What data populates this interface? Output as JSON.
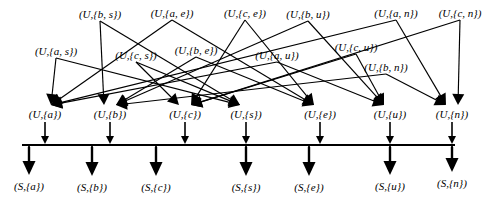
{
  "diagram": {
    "type": "directed-graph",
    "stroke_color": "#000000",
    "background_color": "#ffffff",
    "rows": {
      "top_pairs": [
        {
          "id": "u-bs",
          "label": "(U,{b, s})",
          "x": 100,
          "y": 14
        },
        {
          "id": "u-ae",
          "label": "(U,{a, e})",
          "x": 172,
          "y": 13
        },
        {
          "id": "u-ce",
          "label": "(U,{c, e})",
          "x": 245,
          "y": 13
        },
        {
          "id": "u-bu",
          "label": "(U,{b, u})",
          "x": 308,
          "y": 14
        },
        {
          "id": "u-an",
          "label": "(U,{a, n})",
          "x": 396,
          "y": 13
        },
        {
          "id": "u-cn",
          "label": "(U,{c, n})",
          "x": 460,
          "y": 13
        }
      ],
      "mid_pairs": [
        {
          "id": "u-as",
          "label": "(U,{a, s})",
          "x": 56,
          "y": 51
        },
        {
          "id": "u-cs",
          "label": "(U,{c, s})",
          "x": 136,
          "y": 55
        },
        {
          "id": "u-be",
          "label": "(U,{b, e})",
          "x": 196,
          "y": 50
        },
        {
          "id": "u-au",
          "label": "(U,{a, u})",
          "x": 277,
          "y": 55
        },
        {
          "id": "u-cu",
          "label": "(U,{c, u})",
          "x": 356,
          "y": 47
        },
        {
          "id": "u-bn",
          "label": "(U,{b, n})",
          "x": 386,
          "y": 67
        }
      ],
      "unit_nodes": [
        {
          "id": "u-a",
          "label": "(U,{a})",
          "x": 45,
          "y": 114
        },
        {
          "id": "u-b",
          "label": "(U,{b})",
          "x": 110,
          "y": 114
        },
        {
          "id": "u-c",
          "label": "(U,{c})",
          "x": 185,
          "y": 114
        },
        {
          "id": "u-s",
          "label": "(U,{s})",
          "x": 246,
          "y": 114
        },
        {
          "id": "u-e",
          "label": "(U,{e})",
          "x": 320,
          "y": 114
        },
        {
          "id": "u-u",
          "label": "(U,{u})",
          "x": 390,
          "y": 114
        },
        {
          "id": "u-n",
          "label": "(U,{n})",
          "x": 452,
          "y": 114
        }
      ],
      "sub_nodes": [
        {
          "id": "s-a",
          "label": "(S,{a})",
          "x": 29,
          "y": 186
        },
        {
          "id": "s-b",
          "label": "(S,{b})",
          "x": 92,
          "y": 187
        },
        {
          "id": "s-c",
          "label": "(S,{c})",
          "x": 156,
          "y": 187
        },
        {
          "id": "s-s",
          "label": "(S,{s})",
          "x": 246,
          "y": 187
        },
        {
          "id": "s-e",
          "label": "(S,{e})",
          "x": 309,
          "y": 187
        },
        {
          "id": "s-u",
          "label": "(S,{u})",
          "x": 390,
          "y": 186
        },
        {
          "id": "s-n",
          "label": "(S,{n})",
          "x": 452,
          "y": 183
        }
      ]
    },
    "bar": {
      "x1": 22,
      "x2": 455,
      "y": 145
    },
    "edges_pair_to_unit": [
      {
        "from": "u-as",
        "to": "u-a"
      },
      {
        "from": "u-as",
        "to": "u-s"
      },
      {
        "from": "u-bs",
        "to": "u-b"
      },
      {
        "from": "u-bs",
        "to": "u-s"
      },
      {
        "from": "u-cs",
        "to": "u-c"
      },
      {
        "from": "u-cs",
        "to": "u-s"
      },
      {
        "from": "u-ae",
        "to": "u-a"
      },
      {
        "from": "u-ae",
        "to": "u-e"
      },
      {
        "from": "u-be",
        "to": "u-b"
      },
      {
        "from": "u-be",
        "to": "u-e"
      },
      {
        "from": "u-ce",
        "to": "u-c"
      },
      {
        "from": "u-ce",
        "to": "u-e"
      },
      {
        "from": "u-au",
        "to": "u-a"
      },
      {
        "from": "u-au",
        "to": "u-u"
      },
      {
        "from": "u-bu",
        "to": "u-b"
      },
      {
        "from": "u-bu",
        "to": "u-u"
      },
      {
        "from": "u-cu",
        "to": "u-c"
      },
      {
        "from": "u-cu",
        "to": "u-u"
      },
      {
        "from": "u-an",
        "to": "u-a"
      },
      {
        "from": "u-an",
        "to": "u-n"
      },
      {
        "from": "u-bn",
        "to": "u-b"
      },
      {
        "from": "u-bn",
        "to": "u-n"
      },
      {
        "from": "u-cn",
        "to": "u-c"
      },
      {
        "from": "u-cn",
        "to": "u-n"
      }
    ],
    "edges_unit_to_bar": [
      "u-a",
      "u-b",
      "u-c",
      "u-s",
      "u-e",
      "u-u",
      "u-n"
    ],
    "edges_bar_to_sub": [
      "s-a",
      "s-b",
      "s-c",
      "s-s",
      "s-e",
      "s-u",
      "s-n"
    ]
  }
}
